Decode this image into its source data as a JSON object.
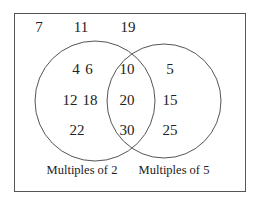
{
  "diagram": {
    "type": "venn",
    "universal_set_outside": [
      "7",
      "11",
      "19"
    ],
    "sets": [
      {
        "label": "Multiples of 2",
        "only": [
          "4",
          "6",
          "12",
          "18",
          "22"
        ]
      },
      {
        "label": "Multiples of 5",
        "only": [
          "5",
          "15",
          "25"
        ]
      }
    ],
    "intersection": [
      "10",
      "20",
      "30"
    ],
    "colors": {
      "stroke": "#555555",
      "text": "#222222",
      "background": "#ffffff"
    }
  },
  "text": {
    "outside": {
      "n7": "7",
      "n11": "11",
      "n19": "19"
    },
    "left": {
      "n4": "4",
      "n6": "6",
      "n12": "12",
      "n18": "18",
      "n22": "22"
    },
    "middle": {
      "n10": "10",
      "n20": "20",
      "n30": "30"
    },
    "right": {
      "n5": "5",
      "n15": "15",
      "n25": "25"
    },
    "labels": {
      "left": "Multiples of 2",
      "right": "Multiples of 5"
    }
  }
}
